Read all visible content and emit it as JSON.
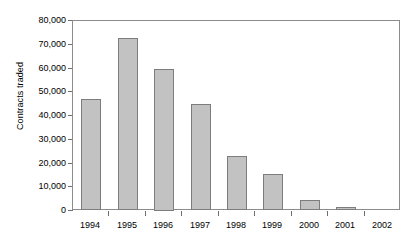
{
  "chart_data": {
    "type": "bar",
    "title": "",
    "subtitle": "",
    "xlabel": "",
    "ylabel": "Contracts traded",
    "categories": [
      "1994",
      "1995",
      "1996",
      "1997",
      "1998",
      "1999",
      "2000",
      "2001",
      "2002"
    ],
    "values": [
      47000,
      73000,
      60000,
      45000,
      23000,
      15500,
      4500,
      1500,
      0
    ],
    "series": [
      {
        "name": "Contracts traded",
        "values": [
          47000,
          73000,
          60000,
          45000,
          23000,
          15500,
          4500,
          1500,
          0
        ]
      }
    ],
    "ylim": [
      0,
      80000
    ],
    "xlim_categories": 9,
    "y_ticks": [
      0,
      10000,
      20000,
      30000,
      40000,
      50000,
      60000,
      70000,
      80000
    ],
    "y_tick_labels": [
      "0",
      "10,000",
      "20,000",
      "30,000",
      "40,000",
      "50,000",
      "60,000",
      "70,000",
      "80,000"
    ],
    "grid": false,
    "legend": false,
    "legend_position": "none",
    "bar_fill_color": "#c2c2c2",
    "bar_border_color": "#7d7d7d",
    "axis_color": "#8c8c8c",
    "text_color": "#000000",
    "background_color": "#ffffff",
    "annotations": []
  }
}
